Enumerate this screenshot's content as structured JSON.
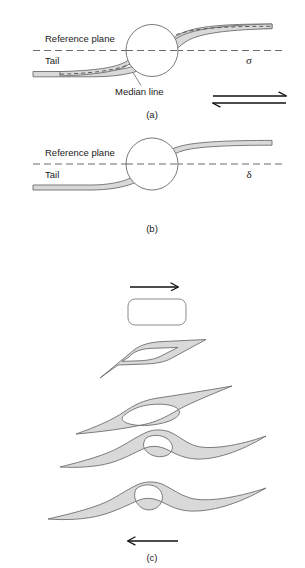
{
  "figure": {
    "panels": [
      {
        "id": "a",
        "letter": "(a)",
        "labels": {
          "reference_plane": "Reference plane",
          "tail": "Tail",
          "median_line": "Median line",
          "symbol": "σ"
        }
      },
      {
        "id": "b",
        "letter": "(b)",
        "labels": {
          "reference_plane": "Reference plane",
          "tail": "Tail",
          "symbol": "δ"
        }
      },
      {
        "id": "c",
        "letter": "(c)",
        "labels": {
          "top_arrow": "arrow-right-icon",
          "bottom_arrow": "arrow-left-icon"
        },
        "stages": [
          {
            "index": 1,
            "name": "undeformed-rounded-rectangle"
          },
          {
            "index": 2,
            "name": "sheared-parallelogram-with-hole"
          },
          {
            "index": 3,
            "name": "asymmetric-wing-with-oval-hole"
          },
          {
            "index": 4,
            "name": "sigmoidal-wing-with-round-hole"
          },
          {
            "index": 5,
            "name": "sigmoidal-wing-with-tilted-oval-hole"
          }
        ]
      }
    ],
    "symbols": {
      "equilibrium_arrows": "double-arrow-equilibrium-icon"
    },
    "colors": {
      "band_fill": "#d9d9d9",
      "band_stroke": "#6e6e6e",
      "reference_line": "#5a5a5a",
      "text": "#1a1a1a",
      "arrow": "#111111",
      "background": "#ffffff"
    }
  }
}
